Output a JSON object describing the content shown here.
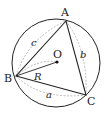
{
  "diagram": {
    "vertices": {
      "A": {
        "label": "A",
        "x": 66,
        "y": 21
      },
      "B": {
        "label": "B",
        "x": 16,
        "y": 76
      },
      "C": {
        "label": "C",
        "x": 86,
        "y": 95
      }
    },
    "center": {
      "label": "O",
      "x": 57,
      "y": 62
    },
    "circle": {
      "cx": 56,
      "cy": 63,
      "r": 44
    },
    "radius_label": "R",
    "side_labels": {
      "a": "a",
      "b": "b",
      "c": "c"
    },
    "colors": {
      "stroke": "#222222",
      "dashed": "#aaaaaa",
      "background": "#ffffff"
    }
  }
}
